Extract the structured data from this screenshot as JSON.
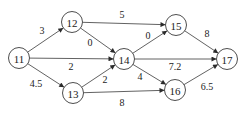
{
  "diagram": {
    "type": "directed-network",
    "nodes": [
      {
        "id": "11",
        "label": "11",
        "x": 19,
        "y": 58
      },
      {
        "id": "12",
        "label": "12",
        "x": 72,
        "y": 22
      },
      {
        "id": "13",
        "label": "13",
        "x": 73,
        "y": 93
      },
      {
        "id": "14",
        "label": "14",
        "x": 124,
        "y": 59
      },
      {
        "id": "15",
        "label": "15",
        "x": 176,
        "y": 25
      },
      {
        "id": "16",
        "label": "16",
        "x": 175,
        "y": 90
      },
      {
        "id": "17",
        "label": "17",
        "x": 227,
        "y": 59
      }
    ],
    "edges": [
      {
        "from": "11",
        "to": "12",
        "weight": "3",
        "lx": 42,
        "ly": 30
      },
      {
        "from": "11",
        "to": "14",
        "weight": "2",
        "lx": 71,
        "ly": 66
      },
      {
        "from": "11",
        "to": "13",
        "weight": "4.5",
        "lx": 36,
        "ly": 83
      },
      {
        "from": "12",
        "to": "15",
        "weight": "5",
        "lx": 122,
        "ly": 14
      },
      {
        "from": "12",
        "to": "14",
        "weight": "0",
        "lx": 90,
        "ly": 42
      },
      {
        "from": "13",
        "to": "14",
        "weight": "2",
        "lx": 105,
        "ly": 79
      },
      {
        "from": "13",
        "to": "16",
        "weight": "8",
        "lx": 122,
        "ly": 102
      },
      {
        "from": "14",
        "to": "15",
        "weight": "0",
        "lx": 148,
        "ly": 35
      },
      {
        "from": "14",
        "to": "17",
        "weight": "7.2",
        "lx": 175,
        "ly": 66
      },
      {
        "from": "14",
        "to": "16",
        "weight": "4",
        "lx": 140,
        "ly": 76
      },
      {
        "from": "15",
        "to": "17",
        "weight": "8",
        "lx": 207,
        "ly": 33
      },
      {
        "from": "16",
        "to": "17",
        "weight": "6.5",
        "lx": 207,
        "ly": 86
      }
    ]
  }
}
